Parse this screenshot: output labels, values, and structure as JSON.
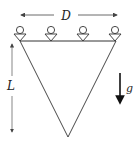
{
  "diagram": {
    "labels": {
      "width": "D",
      "height": "L",
      "gravity": "g"
    },
    "supports": {
      "count": 4,
      "type": "roller-pin-icon"
    },
    "shape": "inverted-triangle",
    "colors": {
      "stroke": "#333333",
      "background": "#ffffff"
    }
  }
}
